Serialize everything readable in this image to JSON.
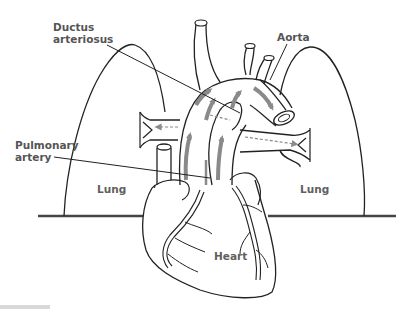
{
  "figure": {
    "colors": {
      "outline": "#222222",
      "arrow": "#8a8a8a",
      "label": "#555555",
      "ground": "#444444"
    }
  },
  "labels": {
    "ductus_line1": "Ductus",
    "ductus_line2": "arteriosus",
    "aorta": "Aorta",
    "pulmonary_line1": "Pulmonary",
    "pulmonary_line2": "artery",
    "lung_left": "Lung",
    "lung_right": "Lung",
    "heart": "Heart"
  },
  "arrows": {
    "solid_flow": [
      "pulmonary-trunk-upward",
      "ductus-to-aorta",
      "aortic-arch-descending",
      "ascending-aorta"
    ],
    "dashed_flow": [
      "to-left-lung",
      "to-right-lung"
    ]
  }
}
